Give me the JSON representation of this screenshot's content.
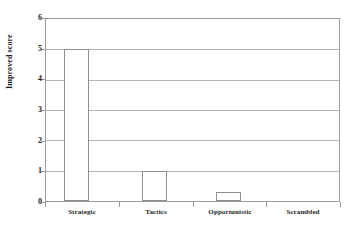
{
  "chart_data": {
    "type": "bar",
    "title": "",
    "xlabel": "",
    "ylabel": "Improved score",
    "categories": [
      "Strategic",
      "Tactics",
      "Opportunistic",
      "Scrambled"
    ],
    "values": [
      5,
      1,
      0.3,
      0
    ],
    "ylim": [
      0,
      6
    ],
    "ytick_labels": [
      "0",
      "1",
      "2",
      "3",
      "4",
      "5",
      "6"
    ],
    "ytick_values": [
      0,
      1,
      2,
      3,
      4,
      5,
      6
    ],
    "grid": true,
    "legend": false,
    "series": [
      {
        "name": "Improved score",
        "values": [
          5,
          1,
          0.3,
          0
        ]
      }
    ],
    "colors": {
      "bar_fill": "#ffffff",
      "bar_edge": "#8f8f8f",
      "grid": "#b5b5b5",
      "axis": "#9b9b9b",
      "text": "#1e1e1e",
      "background": "#ffffff"
    }
  }
}
